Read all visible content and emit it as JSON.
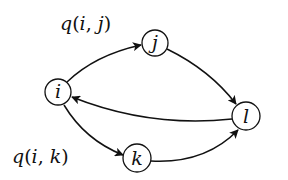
{
  "diagram": {
    "type": "directed-graph",
    "background": "#ffffff",
    "stroke_color": "#111111",
    "nodes": [
      {
        "id": "i",
        "label": "i",
        "cx": 58,
        "cy": 92,
        "r": 13
      },
      {
        "id": "j",
        "label": "j",
        "cx": 155,
        "cy": 43,
        "r": 13
      },
      {
        "id": "k",
        "label": "k",
        "cx": 137,
        "cy": 158,
        "r": 14
      },
      {
        "id": "l",
        "label": "l",
        "cx": 246,
        "cy": 116,
        "r": 14
      }
    ],
    "edges": [
      {
        "from": "i",
        "to": "j",
        "label": "q(i, j)"
      },
      {
        "from": "j",
        "to": "l",
        "label": ""
      },
      {
        "from": "l",
        "to": "i",
        "label": ""
      },
      {
        "from": "i",
        "to": "k",
        "label": "q(i, k)"
      },
      {
        "from": "k",
        "to": "l",
        "label": ""
      }
    ],
    "edge_labels": {
      "ij": {
        "fn": "q",
        "open": "(",
        "a": "i",
        "sep": ", ",
        "b": "j",
        "close": ")"
      },
      "ik": {
        "fn": "q",
        "open": "(",
        "a": "i",
        "sep": ", ",
        "b": "k",
        "close": ")"
      }
    }
  }
}
